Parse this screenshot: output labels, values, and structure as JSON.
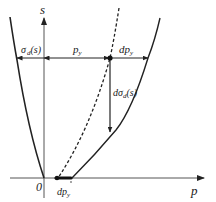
{
  "diagram": {
    "axes": {
      "y_label": "s",
      "x_label": "p",
      "origin_label": "0"
    },
    "labels": {
      "sigma_d": {
        "base": "σ",
        "sub": "d",
        "tail": "(s)"
      },
      "p_y": {
        "base": "p",
        "sub": "y"
      },
      "dp_y_top": {
        "base": "dp",
        "sub": "y"
      },
      "d_sigma_d": {
        "pre": "dσ",
        "sub": "d",
        "tail": "(s)"
      },
      "dp_y_bottom": {
        "base": "dp",
        "sub": "y"
      }
    },
    "curves": [
      {
        "name": "left-yield-curve",
        "style": "solid"
      },
      {
        "name": "dashed-shifted-curve",
        "style": "dashed"
      },
      {
        "name": "right-yield-curve",
        "style": "solid"
      }
    ],
    "colors": {
      "ink": "#222222",
      "axis": "#555555",
      "background": "#ffffff"
    }
  }
}
